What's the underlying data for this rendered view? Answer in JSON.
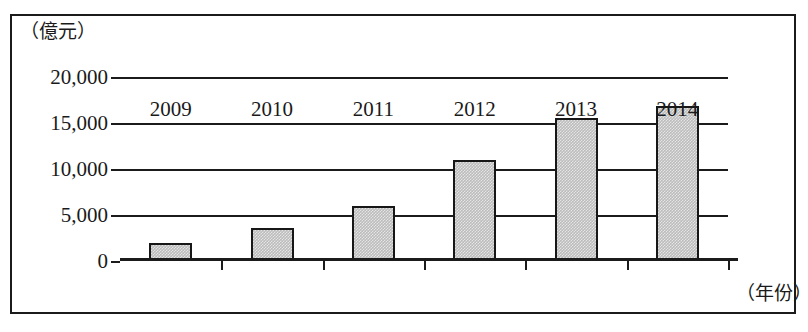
{
  "chart_data": {
    "type": "bar",
    "title": "",
    "subtitle": "",
    "xlabel": "（年份）",
    "ylabel": "（億元）",
    "categories": [
      "2009",
      "2010",
      "2011",
      "2012",
      "2013",
      "2014"
    ],
    "values": [
      2000,
      3600,
      6000,
      11000,
      15500,
      16800
    ],
    "series": [
      {
        "name": "",
        "values": [
          2000,
          3600,
          6000,
          11000,
          15500,
          16800
        ]
      }
    ],
    "ylim": [
      0,
      20000
    ],
    "yticks": [
      0,
      5000,
      10000,
      15000,
      20000
    ],
    "ytick_labels": [
      "0",
      "5,000",
      "10,000",
      "15,000",
      "20,000"
    ],
    "grid": "horizontal",
    "legend": "none",
    "bar_fill_color": "#bcbcbc",
    "bar_edge_color": "#171717",
    "axis_color": "#1b1b1b",
    "background_color": "#ffffff"
  },
  "axes": {
    "unit_caption": "（億元）",
    "x_caption": "（年份）"
  }
}
